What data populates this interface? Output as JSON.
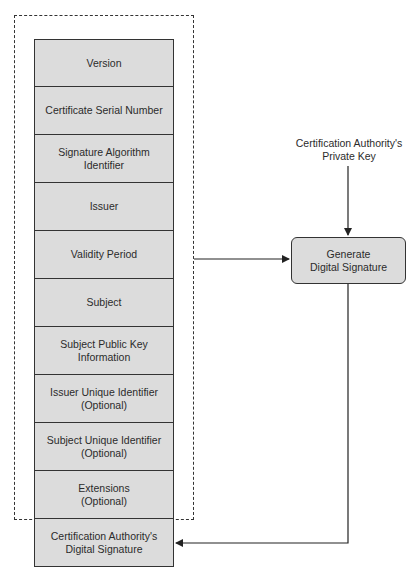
{
  "diagram": {
    "certificate_fields": [
      {
        "lines": [
          "Version"
        ]
      },
      {
        "lines": [
          "Certificate Serial Number"
        ]
      },
      {
        "lines": [
          "Signature Algorithm",
          "Identifier"
        ]
      },
      {
        "lines": [
          "Issuer"
        ]
      },
      {
        "lines": [
          "Validity Period"
        ]
      },
      {
        "lines": [
          "Subject"
        ]
      },
      {
        "lines": [
          "Subject Public Key",
          "Information"
        ]
      },
      {
        "lines": [
          "Issuer Unique Identifier",
          "(Optional)"
        ]
      },
      {
        "lines": [
          "Subject Unique Identifier",
          "(Optional)"
        ]
      },
      {
        "lines": [
          "Extensions",
          "(Optional)"
        ]
      }
    ],
    "signature_field": {
      "lines": [
        "Certification Authority's",
        "Digital Signature"
      ]
    },
    "private_key_label": {
      "lines": [
        "Certification Authority's",
        "Private Key"
      ]
    },
    "process_box": {
      "lines": [
        "Generate",
        "Digital Signature"
      ]
    },
    "colors": {
      "box_fill": "#dcdcdc",
      "stroke": "#333333",
      "background": "#ffffff"
    }
  }
}
